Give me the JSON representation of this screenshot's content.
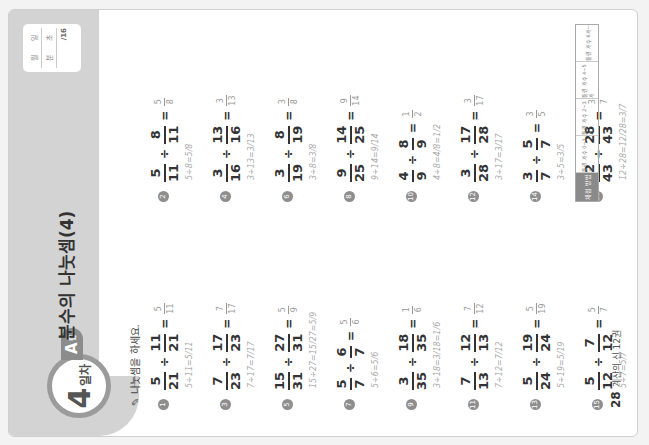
{
  "header": {
    "day_number": "4",
    "day_label": "일차",
    "level": "A",
    "level_suffix": "형",
    "title": "분수의 나눗셈(4)",
    "score_box": {
      "row1": [
        "월",
        "일"
      ],
      "row2": [
        "분",
        "초"
      ],
      "row3": "/16"
    }
  },
  "instruction": "나눗셈을 하세요.",
  "problems_left": [
    {
      "num": "1",
      "a_n": "5",
      "a_d": "21",
      "b_n": "11",
      "b_d": "21",
      "ans_n": "5",
      "ans_d": "11",
      "work": "5÷11=5/11"
    },
    {
      "num": "3",
      "a_n": "7",
      "a_d": "23",
      "b_n": "17",
      "b_d": "23",
      "ans_n": "7",
      "ans_d": "17",
      "work": "7÷17=7/17"
    },
    {
      "num": "5",
      "a_n": "15",
      "a_d": "31",
      "b_n": "27",
      "b_d": "31",
      "ans_n": "5",
      "ans_d": "9",
      "work": "15÷27=15/27=5/9"
    },
    {
      "num": "7",
      "a_n": "5",
      "a_d": "7",
      "b_n": "6",
      "b_d": "7",
      "ans_n": "5",
      "ans_d": "6",
      "work": "5÷6=5/6"
    },
    {
      "num": "9",
      "a_n": "3",
      "a_d": "35",
      "b_n": "18",
      "b_d": "35",
      "ans_n": "1",
      "ans_d": "6",
      "work": "3÷18=3/18=1/6"
    },
    {
      "num": "11",
      "a_n": "7",
      "a_d": "13",
      "b_n": "12",
      "b_d": "13",
      "ans_n": "7",
      "ans_d": "12",
      "work": "7÷12=7/12"
    },
    {
      "num": "13",
      "a_n": "5",
      "a_d": "24",
      "b_n": "19",
      "b_d": "24",
      "ans_n": "5",
      "ans_d": "19",
      "work": "5÷19=5/19"
    },
    {
      "num": "15",
      "a_n": "5",
      "a_d": "12",
      "b_n": "7",
      "b_d": "12",
      "ans_n": "5",
      "ans_d": "7",
      "work": "5÷7=5/7"
    }
  ],
  "problems_right": [
    {
      "num": "2",
      "a_n": "5",
      "a_d": "11",
      "b_n": "8",
      "b_d": "11",
      "ans_n": "5",
      "ans_d": "8",
      "work": "5÷8=5/8"
    },
    {
      "num": "4",
      "a_n": "3",
      "a_d": "16",
      "b_n": "13",
      "b_d": "16",
      "ans_n": "3",
      "ans_d": "13",
      "work": "3÷13=3/13"
    },
    {
      "num": "6",
      "a_n": "3",
      "a_d": "19",
      "b_n": "8",
      "b_d": "19",
      "ans_n": "3",
      "ans_d": "8",
      "work": "3÷8=3/8"
    },
    {
      "num": "8",
      "a_n": "9",
      "a_d": "25",
      "b_n": "14",
      "b_d": "25",
      "ans_n": "9",
      "ans_d": "14",
      "work": "9÷14=9/14"
    },
    {
      "num": "10",
      "a_n": "4",
      "a_d": "9",
      "b_n": "8",
      "b_d": "9",
      "ans_n": "1",
      "ans_d": "2",
      "work": "4÷8=4/8=1/2"
    },
    {
      "num": "12",
      "a_n": "3",
      "a_d": "28",
      "b_n": "17",
      "b_d": "28",
      "ans_n": "3",
      "ans_d": "17",
      "work": "3÷17=3/17"
    },
    {
      "num": "14",
      "a_n": "3",
      "a_d": "7",
      "b_n": "5",
      "b_d": "7",
      "ans_n": "3",
      "ans_d": "5",
      "work": "3÷5=3/5"
    },
    {
      "num": "16",
      "a_n": "12",
      "a_d": "43",
      "b_n": "28",
      "b_d": "43",
      "ans_n": "3",
      "ans_d": "7",
      "work": "12÷28=12/28=3/7"
    }
  ],
  "info_box": {
    "head": "채점 방법",
    "cells": [
      "틀린 개수 0~1개",
      "틀린 개수 2~3개",
      "틀린 개수 4~5개",
      "틀린 개수 6개~"
    ]
  },
  "footer": {
    "page": "28",
    "book": "계산의 신 12권"
  }
}
